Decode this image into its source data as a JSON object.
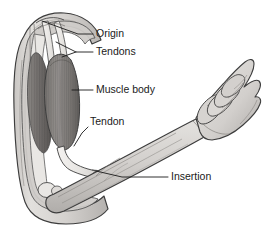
{
  "figure": {
    "view": "lateral",
    "background_color": "#ffffff",
    "outline_color": "#3d3d3d",
    "skin_fill": "#d8d6d3",
    "skin_shadow": "#b8b5b2",
    "muscle_fill": "#8e8b88",
    "muscle_dark": "#6e6b69",
    "tendon_fill": "#efedeb",
    "bone_fill": "#e8e6e3",
    "leader_color": "#1a1a1a",
    "labels": [
      {
        "id": "origin",
        "text": "Origin",
        "text_x": 96,
        "text_y": 34,
        "leader": "M 93 34 L 78 34 L 42 21",
        "description": "Proximal attachment of the muscle at the shoulder"
      },
      {
        "id": "tendons",
        "text": "Tendons",
        "text_x": 96,
        "text_y": 52,
        "leader": "M 93 52 L 76 52 L 56 42",
        "leader2": "M 76 52 L 62 57",
        "description": "Fibrous cords connecting muscle to bone at the origin"
      },
      {
        "id": "muscle-body",
        "text": "Muscle body",
        "text_x": 96,
        "text_y": 90,
        "leader": "M 93 90 L 72 90",
        "description": "Fleshy contractile belly of the biceps"
      },
      {
        "id": "tendon",
        "text": "Tendon",
        "text_x": 90,
        "text_y": 122,
        "leader": "M 88 127 L 82 133 L 74 146",
        "description": "Distal tendon crossing the elbow joint"
      },
      {
        "id": "insertion",
        "text": "Insertion",
        "text_x": 171,
        "text_y": 177,
        "leader": "M 168 177 L 122 177 L 96 171",
        "description": "Distal attachment of the muscle on the forearm bone"
      }
    ]
  }
}
